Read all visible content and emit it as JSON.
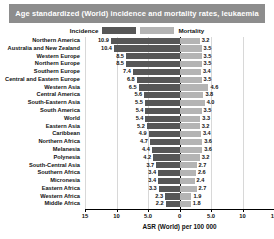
{
  "title": "Age standardized (World) incidence and mortality rates, leukaemia",
  "legend": {
    "incidence_label": "Incidence",
    "mortality_label": "Mortality",
    "incidence_color": "#575757",
    "mortality_color": "#b4b4b4",
    "position": "top-center"
  },
  "axis": {
    "title": "ASR (World) per 100 000",
    "tick_labels": [
      "15",
      "10",
      "5.0",
      "0",
      "5.0",
      "10",
      "15"
    ],
    "max": 15,
    "grid": true
  },
  "chart_data": {
    "type": "bar",
    "orientation": "horizontal-diverging",
    "title": "Age standardized (World) incidence and mortality rates, leukaemia",
    "xlabel": "ASR (World) per 100 000",
    "ylabel": "",
    "xlim": [
      -15,
      15
    ],
    "grid": true,
    "legend": [
      "Incidence",
      "Mortality"
    ],
    "categories": [
      "Northern America",
      "Australia and New Zealand",
      "Western Europe",
      "Northern Europe",
      "Southern Europe",
      "Central and Eastern Europe",
      "Western Asia",
      "Central America",
      "South-Eastern Asia",
      "South America",
      "World",
      "Eastern Asia",
      "Caribbean",
      "Northern Africa",
      "Melanesia",
      "Polynesia",
      "South-Central Asia",
      "Southern Africa",
      "Micronesia",
      "Eastern Africa",
      "Western Africa",
      "Middle Africa"
    ],
    "series": [
      {
        "name": "Incidence",
        "side": "left",
        "color": "#575757",
        "values": [
          10.9,
          10.4,
          8.5,
          8.5,
          7.4,
          6.8,
          6.5,
          5.6,
          5.5,
          5.4,
          5.4,
          5.2,
          4.9,
          4.7,
          4.4,
          4.2,
          3.7,
          3.4,
          3.4,
          3.3,
          2.3,
          2.2
        ]
      },
      {
        "name": "Mortality",
        "side": "right",
        "color": "#b4b4b4",
        "values": [
          3.2,
          3.5,
          3.5,
          3.5,
          3.4,
          3.5,
          4.6,
          3.8,
          4.0,
          3.5,
          3.3,
          3.2,
          3.4,
          3.6,
          3.6,
          3.2,
          2.7,
          2.6,
          2.4,
          2.7,
          1.9,
          1.8
        ]
      }
    ]
  }
}
